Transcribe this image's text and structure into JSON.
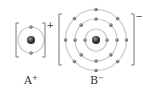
{
  "diagram": {
    "type": "ion electron shell diagram",
    "ions": [
      {
        "label": "A",
        "charge": "+",
        "center": [
          31,
          40
        ],
        "shells": [
          {
            "radius": 13,
            "electrons": 2
          }
        ],
        "bracket": {
          "left": 16,
          "right": 45,
          "top": 23,
          "bottom": 57
        }
      },
      {
        "label": "B",
        "charge": "−",
        "center": [
          96,
          40
        ],
        "shells": [
          {
            "radius": 11,
            "electrons": 2
          },
          {
            "radius": 21,
            "electrons": 8
          },
          {
            "radius": 30.5,
            "electrons": 8
          }
        ],
        "bracket": {
          "left": 59,
          "right": 134,
          "top": 14,
          "bottom": 65
        }
      }
    ],
    "colors": {
      "shell": "#c8c8c8",
      "electron": "#6a6a6a",
      "nucleus": "#3a3a3a",
      "bracket": "#777777",
      "text": "#333333"
    }
  }
}
